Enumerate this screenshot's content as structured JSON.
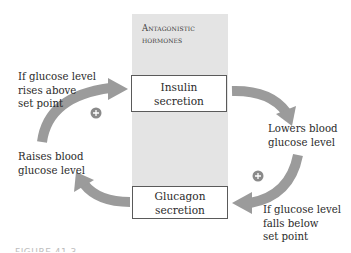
{
  "diagram": {
    "panel": {
      "title_line1": "Antagonistic",
      "title_line2": "hormones"
    },
    "boxes": {
      "insulin": {
        "line1": "Insulin",
        "line2": "secretion"
      },
      "glucagon": {
        "line1": "Glucagon",
        "line2": "secretion"
      }
    },
    "labels": {
      "rises": [
        "If glucose level",
        "rises above",
        "set point"
      ],
      "lowers": [
        "Lowers blood",
        "glucose level"
      ],
      "falls": [
        "If glucose level",
        "falls below",
        "set point"
      ],
      "raises": [
        "Raises blood",
        "glucose level"
      ]
    },
    "stimulus_markers": [
      {
        "symbol": "+",
        "position": "left-arc"
      },
      {
        "symbol": "+",
        "position": "right-arc"
      }
    ],
    "caption": "FIGURE 41.3",
    "colors": {
      "arrow": "#9b9b9b",
      "panel": "#e4e4e4",
      "box_border": "#5a5a5a",
      "marker": "#8a8a8a"
    }
  }
}
